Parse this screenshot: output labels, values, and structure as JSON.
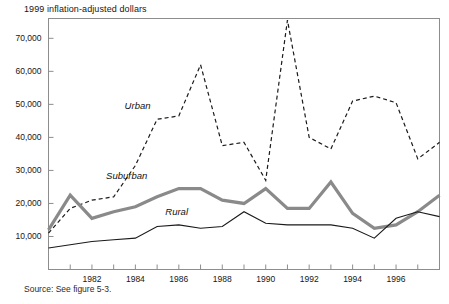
{
  "figure": {
    "title": "1999 inflation-adjusted dollars",
    "source": "Source:  See figure 5-3."
  },
  "colors": {
    "urban": "#1a1a1a",
    "suburban": "#8a8a8a",
    "rural": "#1a1a1a",
    "frame": "#8d8d8d",
    "text": "#161616"
  },
  "chart_data": {
    "type": "line",
    "title": "1999 inflation-adjusted dollars",
    "xlabel": "",
    "ylabel": "",
    "xlim": [
      1980,
      1998
    ],
    "ylim": [
      0,
      76000
    ],
    "yticks": [
      10000,
      20000,
      30000,
      40000,
      50000,
      60000,
      70000
    ],
    "ytick_labels": [
      "10,000",
      "20,000",
      "30,000",
      "40,000",
      "50,000",
      "60,000",
      "70,000"
    ],
    "xticks": [
      1980,
      1981,
      1982,
      1983,
      1984,
      1985,
      1986,
      1987,
      1988,
      1989,
      1990,
      1991,
      1992,
      1993,
      1994,
      1995,
      1996,
      1997,
      1998
    ],
    "xtick_labels": [
      "",
      "",
      "1982",
      "",
      "1984",
      "",
      "1986",
      "",
      "1988",
      "",
      "1990",
      "",
      "1992",
      "",
      "1994",
      "",
      "1996",
      "",
      ""
    ],
    "grid": false,
    "legend": "inline-annotations",
    "x": [
      1980,
      1981,
      1982,
      1983,
      1984,
      1985,
      1986,
      1987,
      1988,
      1989,
      1990,
      1991,
      1992,
      1993,
      1994,
      1995,
      1996,
      1997,
      1998
    ],
    "series": [
      {
        "name": "Urban",
        "style": "dashed",
        "color": "#1a1a1a",
        "label_x": 1984.1,
        "label_y": 48500,
        "values": [
          11000,
          18500,
          21000,
          22000,
          31500,
          45500,
          46500,
          62000,
          37500,
          38500,
          27000,
          75500,
          40000,
          36500,
          51000,
          52500,
          50500,
          33500,
          38500
        ]
      },
      {
        "name": "Suburban",
        "style": "solid-thick",
        "color": "#8a8a8a",
        "label_x": 1983.6,
        "label_y": 27500,
        "values": [
          12000,
          22500,
          15500,
          17500,
          19000,
          22000,
          24500,
          24500,
          21000,
          20000,
          24500,
          18500,
          18500,
          26500,
          17000,
          12500,
          13500,
          17500,
          22500
        ]
      },
      {
        "name": "Rural",
        "style": "solid-thin",
        "color": "#1a1a1a",
        "label_x": 1985.9,
        "label_y": 16500,
        "values": [
          6500,
          7500,
          8500,
          9000,
          9500,
          13000,
          13500,
          12500,
          13000,
          17500,
          14000,
          13500,
          13500,
          13500,
          12500,
          9500,
          15500,
          17500,
          16000
        ]
      }
    ],
    "annotations": [
      {
        "text": "Urban",
        "x": 1984.1,
        "y": 48500
      },
      {
        "text": "Suburban",
        "x": 1983.6,
        "y": 27500
      },
      {
        "text": "Rural",
        "x": 1985.9,
        "y": 16500
      }
    ]
  }
}
